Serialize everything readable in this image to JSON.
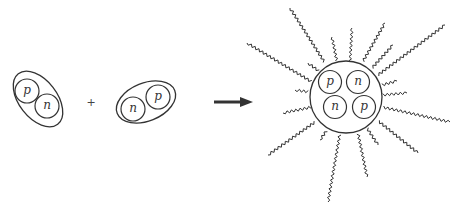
{
  "diagram": {
    "reactant_1": {
      "name": "deuteron",
      "particles": [
        {
          "label": "p",
          "cx": 27,
          "cy": 91
        },
        {
          "label": "n",
          "cx": 47,
          "cy": 106
        }
      ]
    },
    "operator": "+",
    "reactant_2": {
      "name": "deuteron",
      "particles": [
        {
          "label": "n",
          "cx": 133,
          "cy": 109
        },
        {
          "label": "p",
          "cx": 158,
          "cy": 97
        }
      ]
    },
    "arrow": {
      "direction": "right",
      "meaning": "yields"
    },
    "product": {
      "name": "helium-4 nucleus",
      "particles": [
        {
          "label": "p",
          "cx": 330,
          "cy": 82
        },
        {
          "label": "n",
          "cx": 358,
          "cy": 82
        },
        {
          "label": "n",
          "cx": 335,
          "cy": 107
        },
        {
          "label": "p",
          "cx": 364,
          "cy": 107
        }
      ],
      "radiation": "wavy energy rays emitted radially",
      "ray_count": 19
    },
    "colors": {
      "stroke": "#333333",
      "background": "#ffffff"
    }
  }
}
